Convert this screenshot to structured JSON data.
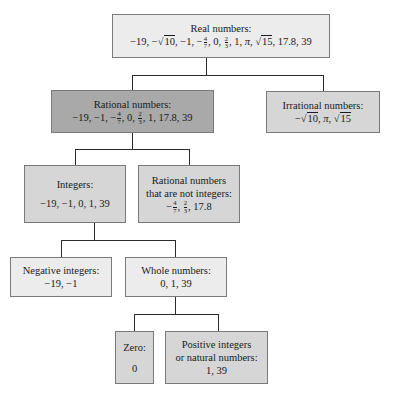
{
  "diagram": {
    "nodes": {
      "real": {
        "title": "Real numbers:",
        "members": [
          "−19",
          "−√10",
          "−1",
          "−4/7",
          "0",
          "2/3",
          "1",
          "π",
          "√15",
          "17.8",
          "39"
        ]
      },
      "rational": {
        "title": "Rational numbers:",
        "members": [
          "−19",
          "−1",
          "−4/7",
          "0",
          "2/3",
          "1",
          "17.8",
          "39"
        ]
      },
      "irrational": {
        "title": "Irrational numbers:",
        "members": [
          "−√10",
          "π",
          "√15"
        ]
      },
      "integers": {
        "title": "Integers:",
        "members_text": "−19, −1, 0, 1, 39"
      },
      "rational_not_integers": {
        "title_line1": "Rational numbers",
        "title_line2": "that are not integers:",
        "members": [
          "−4/7",
          "2/3",
          "17.8"
        ]
      },
      "negative_integers": {
        "title": "Negative integers:",
        "members_text": "−19, −1"
      },
      "whole_numbers": {
        "title": "Whole numbers:",
        "members_text": "0, 1, 39"
      },
      "zero": {
        "title": "Zero:",
        "members_text": "0"
      },
      "positive_integers": {
        "title_line1": "Positive integers",
        "title_line2": "or natural numbers:",
        "members_text": "1, 39"
      }
    },
    "edges": [
      [
        "real",
        "rational"
      ],
      [
        "real",
        "irrational"
      ],
      [
        "rational",
        "integers"
      ],
      [
        "rational",
        "rational_not_integers"
      ],
      [
        "integers",
        "negative_integers"
      ],
      [
        "integers",
        "whole_numbers"
      ],
      [
        "whole_numbers",
        "zero"
      ],
      [
        "whole_numbers",
        "positive_integers"
      ]
    ],
    "text": {
      "neg": "−",
      "comma": ", ",
      "n19": "−19",
      "n1": "−1",
      "zero": "0",
      "one": "1",
      "pi": "π",
      "n178": "17.8",
      "n39": "39",
      "sqrt": "√",
      "ten": "10",
      "fifteen": "15",
      "four": "4",
      "seven": "7",
      "two": "2",
      "three": "3"
    },
    "colors": {
      "light_fill": "#ececec",
      "mid_fill": "#d6d6d6",
      "dark_fill": "#a9a9a9",
      "border": "#7a7a7a",
      "line": "#2a2a2a"
    }
  }
}
